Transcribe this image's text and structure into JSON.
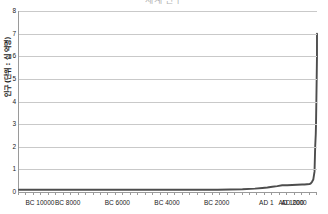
{
  "chart_data": {
    "type": "line",
    "title": "세계 인구",
    "xlabel": "",
    "ylabel": "인구 (단위 : 십 억명)",
    "ylim": [
      0,
      8
    ],
    "xlim": [
      -10000,
      2000
    ],
    "y_ticks": [
      0,
      1,
      2,
      3,
      4,
      5,
      6,
      7,
      8
    ],
    "y_tick_labels": [
      "0",
      "1",
      "2",
      "3",
      "4",
      "5",
      "6",
      "7",
      "8"
    ],
    "x_ticks": [
      -10000,
      -8000,
      -6000,
      -4000,
      -2000,
      1,
      1000,
      2000
    ],
    "x_tick_labels": [
      "BC 10000",
      "BC 8000",
      "BC 6000",
      "BC 4000",
      "BC 2000",
      "AD 1",
      "AD 1000",
      "AD 2000"
    ],
    "grid": "horizontal",
    "legend": "none",
    "series": [
      {
        "name": "세계 인구",
        "color": "#4d4d4d",
        "x": [
          -10000,
          -9000,
          -8000,
          -7000,
          -6000,
          -5000,
          -4000,
          -3000,
          -2500,
          -2000,
          -1500,
          -1000,
          -500,
          -200,
          1,
          200,
          400,
          600,
          800,
          1000,
          1200,
          1400,
          1500,
          1600,
          1700,
          1750,
          1800,
          1850,
          1900,
          1927,
          1950,
          1960,
          1974,
          1987,
          1999,
          2000
        ],
        "values": [
          0.1,
          0.1,
          0.1,
          0.1,
          0.1,
          0.1,
          0.1,
          0.1,
          0.1,
          0.1,
          0.11,
          0.12,
          0.15,
          0.18,
          0.2,
          0.23,
          0.26,
          0.3,
          0.3,
          0.31,
          0.32,
          0.33,
          0.33,
          0.34,
          0.35,
          0.38,
          0.45,
          0.55,
          0.9,
          2.0,
          2.55,
          3.0,
          4.0,
          5.0,
          6.0,
          7.0
        ]
      }
    ]
  },
  "axis": {
    "y_axis_title": "인구 (단위 : 십 억명)"
  }
}
